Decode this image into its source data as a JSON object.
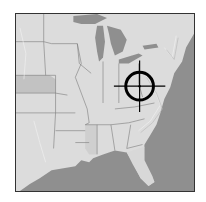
{
  "map": {
    "region": "Eastern United States",
    "style": "grayscale shaded relief",
    "colors": {
      "land": "#dcdcdc",
      "land_shade": "#c8c8c8",
      "water": "#8f8f8f",
      "borders": "#7a7a7a",
      "marker": "#000000"
    },
    "marker": {
      "type": "crosshair-target",
      "location_hint": "Virginia / West Virginia",
      "x": 140,
      "y": 86
    }
  }
}
